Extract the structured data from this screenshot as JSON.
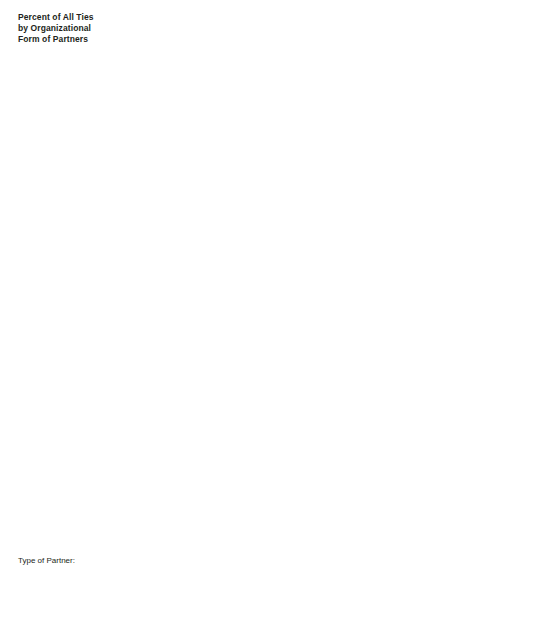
{
  "title": "Percent of All Ties\nby Organizational\nForm of Partners",
  "legend": {
    "heading": "Type of Partner:",
    "items": [
      {
        "label": "DBFs",
        "color": "#aab6d0"
      },
      {
        "label": "Financial Institutions",
        "color": "#74767a"
      },
      {
        "label": "Government Institutes",
        "color": "#8b4433"
      },
      {
        "label": "Pharma Corporations",
        "color": "#f9e08b"
      },
      {
        "label": "Public Research Organizations",
        "color": "#f15a29"
      },
      {
        "label": "Biomed Suppliers",
        "color": "#ef6d6d"
      }
    ]
  },
  "chart_data": {
    "type": "bar",
    "title": "Percent of All Ties by Organizational Form of Partners",
    "xlabel": "",
    "ylabel": "Percent of All Ties",
    "ylim": [
      0,
      80
    ],
    "yticks": [
      20,
      40,
      60,
      80
    ],
    "grid": true,
    "legend_position": "bottom-left",
    "categories": [
      "Boston",
      "Bay Area",
      "San Diego",
      "New York",
      "New Jersey",
      "Philadelphia",
      "D.C. Area",
      "Research\nTriangle, NC",
      "Houston",
      "Seattle",
      "Los Angeles"
    ],
    "series_names": [
      "DBFs",
      "Financial Institutions",
      "Government Institutes",
      "Pharma Corporations",
      "Public Research Organizations",
      "Biomed Suppliers"
    ],
    "series_colors": [
      "#aab6d0",
      "#74767a",
      "#8b4433",
      "#f9e08b",
      "#f15a29",
      "#ef6d6d"
    ],
    "panels": [
      {
        "year": "1990",
        "series": [
          {
            "name": "DBFs",
            "values": [
              31,
              33,
              19,
              1,
              14,
              27,
              9,
              14,
              13,
              68,
              24
            ]
          },
          {
            "name": "Financial Institutions",
            "values": [
              22,
              45,
              28,
              55,
              13,
              17,
              12,
              0,
              53,
              0,
              27
            ]
          },
          {
            "name": "Government Institutes",
            "values": [
              0,
              0,
              0,
              0,
              0,
              0,
              79,
              0,
              0,
              0,
              0
            ]
          },
          {
            "name": "Pharma Corporations",
            "values": [
              5,
              15,
              7,
              34,
              81,
              54,
              6,
              0,
              12,
              0,
              8
            ]
          },
          {
            "name": "Public Research Organizations",
            "values": [
              43,
              14,
              43,
              19,
              3,
              21,
              9,
              82,
              40,
              32,
              41
            ]
          },
          {
            "name": "Biomed Suppliers",
            "values": [
              11,
              8,
              18,
              3,
              0,
              0,
              1,
              14,
              0,
              14,
              27
            ]
          }
        ],
        "arrows": []
      },
      {
        "year": "1996",
        "series": [
          {
            "name": "DBFs",
            "values": [
              38,
              54,
              50,
              2,
              8,
              31,
              12,
              10,
              35,
              47,
              26
            ]
          },
          {
            "name": "Financial Institutions",
            "values": [
              41,
              43,
              28,
              59,
              20,
              27,
              16,
              0,
              40,
              12,
              22
            ]
          },
          {
            "name": "Government Institutes",
            "values": [
              0,
              1,
              0,
              0,
              0,
              0,
              72,
              0,
              0,
              0,
              0
            ]
          },
          {
            "name": "Pharma Corporations",
            "values": [
              4,
              4,
              7,
              27,
              78,
              35,
              4,
              11,
              11,
              11,
              19
            ]
          },
          {
            "name": "Public Research Organizations",
            "values": [
              24,
              3,
              22,
              21,
              5,
              14,
              12,
              83,
              19,
              44,
              40
            ]
          },
          {
            "name": "Biomed Suppliers",
            "values": [
              5,
              0,
              8,
              3,
              0,
              14,
              2,
              0,
              0,
              4,
              19
            ]
          }
        ],
        "arrows": [
          {
            "panel_x": 44,
            "panel_y": 62
          },
          {
            "panel_x": 92,
            "panel_y": 43
          },
          {
            "panel_x": 140,
            "panel_y": 50
          }
        ]
      },
      {
        "year": "2002",
        "series": [
          {
            "name": "DBFs",
            "values": [
              46,
              56,
              55,
              9,
              1,
              32,
              14,
              18,
              62,
              60,
              16
            ]
          },
          {
            "name": "Financial Institutions",
            "values": [
              34,
              39,
              18,
              61,
              15,
              33,
              15,
              30,
              16,
              18,
              43
            ]
          },
          {
            "name": "Government Institutes",
            "values": [
              0,
              0,
              0,
              0,
              0,
              0,
              75,
              0,
              0,
              0,
              0
            ]
          },
          {
            "name": "Pharma Corporations",
            "values": [
              5,
              6,
              10,
              26,
              80,
              36,
              2,
              8,
              17,
              4,
              21
            ]
          },
          {
            "name": "Public Research Organizations",
            "values": [
              22,
              7,
              28,
              17,
              4,
              8,
              13,
              50,
              31,
              33,
              26
            ]
          },
          {
            "name": "Biomed Suppliers",
            "values": [
              8,
              10,
              8,
              0,
              0,
              13,
              1,
              19,
              0,
              9,
              20
            ]
          }
        ],
        "arrows": [
          {
            "panel_x": 44,
            "panel_y": 47
          },
          {
            "panel_x": 400,
            "panel_y": 72
          },
          {
            "panel_x": 494,
            "panel_y": 48
          }
        ]
      }
    ]
  }
}
